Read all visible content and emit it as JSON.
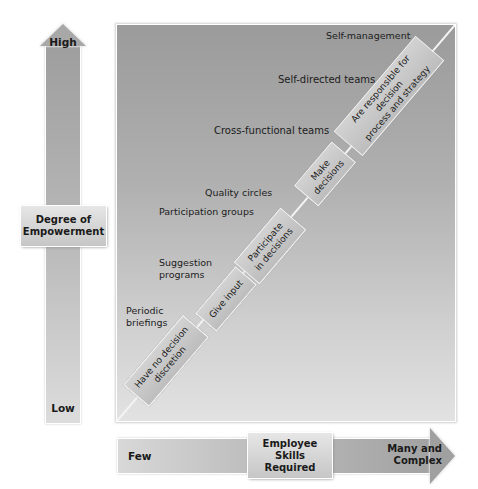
{
  "vertical_axis": {
    "title_line1": "Degree of",
    "title_line2": "Empowerment",
    "high_label": "High",
    "low_label": "Low"
  },
  "horizontal_axis": {
    "title_line1": "Employee",
    "title_line2": "Skills Required",
    "few_label": "Few",
    "many_line1": "Many and",
    "many_line2": "Complex"
  },
  "programs": [
    {
      "line1": "Periodic",
      "line2": "briefings"
    },
    {
      "line1": "Suggestion",
      "line2": "programs"
    },
    {
      "line1": "Participation groups",
      "line2": ""
    },
    {
      "line1": "Quality circles",
      "line2": ""
    },
    {
      "line1": "Cross-functional teams",
      "line2": ""
    },
    {
      "line1": "Self-directed teams",
      "line2": ""
    },
    {
      "line1": "Self-management",
      "line2": ""
    }
  ],
  "employee_roles": [
    {
      "line1": "Have no decision",
      "line2": "discretion"
    },
    {
      "line1": "Give input",
      "line2": ""
    },
    {
      "line1": "Participate",
      "line2": "in decisions"
    },
    {
      "line1": "Make",
      "line2": "decisions"
    },
    {
      "line1": "Are responsible for decision",
      "line2": "process and strategy"
    }
  ],
  "colors": {
    "panel_top": "#9b9b9b",
    "panel_bottom": "#e2e2e2",
    "box_fill": "#c8c8c8",
    "line": "#f2f2f2"
  }
}
